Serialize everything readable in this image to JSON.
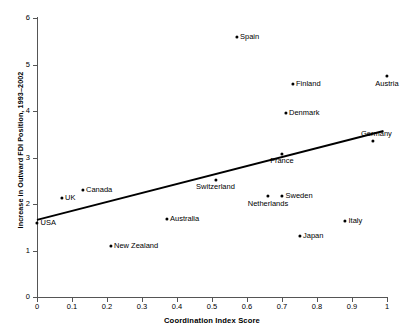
{
  "chart_data": {
    "type": "scatter",
    "title": "",
    "xlabel": "Coordination Index Score",
    "ylabel": "Increase in Outward FDI Position, 1993–2002",
    "xlim": [
      0,
      1
    ],
    "ylim": [
      0,
      6
    ],
    "xticks": [
      "0",
      "0.1",
      "0.2",
      "0.3",
      "0.4",
      "0.5",
      "0.6",
      "0.7",
      "0.8",
      "0.9",
      "1"
    ],
    "yticks": [
      "0",
      "1",
      "2",
      "3",
      "4",
      "5",
      "6"
    ],
    "grid": false,
    "legend": "none",
    "marker_color": "#000000",
    "trendline_color": "#000000",
    "points": [
      {
        "label": "Spain",
        "x": 0.57,
        "y": 5.6,
        "pos": "right"
      },
      {
        "label": "Finland",
        "x": 0.73,
        "y": 4.58,
        "pos": "right"
      },
      {
        "label": "Austria",
        "x": 1.0,
        "y": 4.75,
        "pos": "below"
      },
      {
        "label": "Denmark",
        "x": 0.71,
        "y": 3.96,
        "pos": "right"
      },
      {
        "label": "Germany",
        "x": 0.96,
        "y": 3.35,
        "pos": "above-right"
      },
      {
        "label": "France",
        "x": 0.7,
        "y": 3.08,
        "pos": "below"
      },
      {
        "label": "Switzerland",
        "x": 0.51,
        "y": 2.52,
        "pos": "below"
      },
      {
        "label": "Canada",
        "x": 0.13,
        "y": 2.3,
        "pos": "right"
      },
      {
        "label": "UK",
        "x": 0.07,
        "y": 2.13,
        "pos": "right"
      },
      {
        "label": "Netherlands",
        "x": 0.66,
        "y": 2.17,
        "pos": "below"
      },
      {
        "label": "Sweden",
        "x": 0.7,
        "y": 2.17,
        "pos": "right"
      },
      {
        "label": "Australia",
        "x": 0.37,
        "y": 1.68,
        "pos": "right"
      },
      {
        "label": "Italy",
        "x": 0.88,
        "y": 1.64,
        "pos": "right"
      },
      {
        "label": "USA",
        "x": 0.0,
        "y": 1.6,
        "pos": "right"
      },
      {
        "label": "Japan",
        "x": 0.75,
        "y": 1.31,
        "pos": "right"
      },
      {
        "label": "New Zealand",
        "x": 0.21,
        "y": 1.1,
        "pos": "right"
      }
    ],
    "trendline": {
      "x0": 0.0,
      "y0": 1.66,
      "x1": 0.99,
      "y1": 3.57
    }
  }
}
